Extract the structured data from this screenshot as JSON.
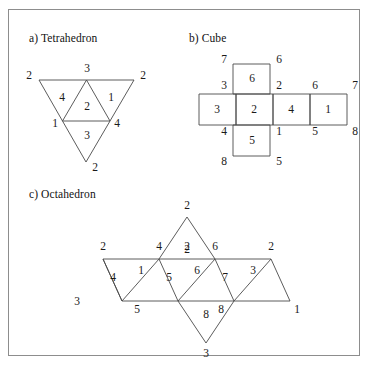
{
  "figure": {
    "sections": [
      {
        "id": "tetrahedron",
        "caption": "a) Tetrahedron"
      },
      {
        "id": "cube",
        "caption": "b) Cube"
      },
      {
        "id": "octahedron",
        "caption": "c) Octahedron"
      }
    ],
    "border_color": "#8d8d8d",
    "line_color": "#4a4a4a",
    "text_color": "#1a1a1a"
  },
  "tetrahedron": {
    "face_labels": [
      "4",
      "2",
      "1",
      "3"
    ],
    "vertex_labels": [
      "2",
      "3",
      "2",
      "1",
      "4",
      "2"
    ],
    "labels": {
      "face_4": "4",
      "face_2": "2",
      "face_1": "1",
      "face_3": "3",
      "corner_left": "2",
      "corner_top": "3",
      "corner_right": "2",
      "mid_left": "1",
      "mid_right": "4",
      "apex_bottom": "2"
    }
  },
  "cube": {
    "face_labels": [
      "6",
      "3",
      "2",
      "4",
      "1",
      "5"
    ],
    "labels": {
      "face_top": "6",
      "face_row_1": "3",
      "face_row_2": "2",
      "face_row_3": "4",
      "face_row_4": "1",
      "face_bottom": "5",
      "v_top_left": "7",
      "v_top_right": "6",
      "v_row_top_left": "3",
      "v_row_top_mid": "2",
      "v_row_top_mid2": "6",
      "v_row_top_right": "7",
      "v_row_bot_left": "4",
      "v_row_bot_mid": "1",
      "v_row_bot_mid2": "5",
      "v_row_bot_right": "8",
      "v_bottom_left": "8",
      "v_bottom_right": "5"
    }
  },
  "octahedron": {
    "face_labels": [
      "4",
      "1",
      "5",
      "6",
      "7",
      "3",
      "2",
      "8"
    ],
    "labels": {
      "face_strip_1": "4",
      "face_strip_2": "1",
      "face_strip_3": "5",
      "face_strip_4": "6",
      "face_strip_5": "7",
      "face_strip_6": "3",
      "face_top": "2",
      "face_bottom": "8",
      "v_apex_top": "2",
      "v_top_1": "2",
      "v_top_2": "4",
      "v_top_3": "2",
      "v_top_4": "6",
      "v_top_5": "2",
      "v_bot_1": "3",
      "v_bot_2": "5",
      "v_bot_3": "8",
      "v_bot_4": "1",
      "v_bot_5": "3",
      "v_apex_bottom": "3"
    }
  }
}
